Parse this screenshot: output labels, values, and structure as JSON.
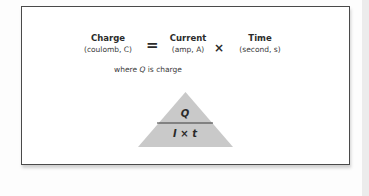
{
  "diagram": {
    "equation": {
      "lhs": {
        "name": "Charge",
        "unit": "(coulomb, C)"
      },
      "equals_symbol": "=",
      "factor1": {
        "name": "Current",
        "unit": "(amp, A)"
      },
      "times_symbol": "×",
      "factor2": {
        "name": "Time",
        "unit": "(second, s)"
      }
    },
    "note": {
      "prefix": "where ",
      "symbol": "Q",
      "suffix": " is charge"
    },
    "triangle": {
      "top": "Q",
      "bottom": "I × t",
      "fill_color": "#c9c9c9",
      "line_color": "#3a3a3a"
    },
    "colors": {
      "border": "#4a4a4a",
      "background": "#ffffff",
      "text": "#2b2b2b"
    }
  }
}
